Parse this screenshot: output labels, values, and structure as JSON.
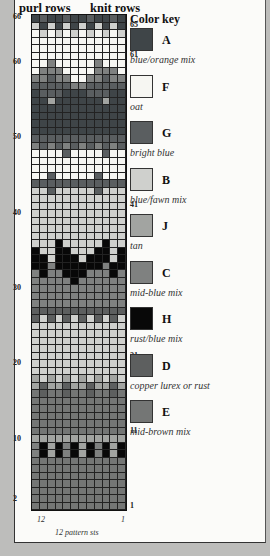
{
  "headers": {
    "purl": "purl rows",
    "knit": "knit rows"
  },
  "left_labels": [
    {
      "row": 66,
      "text": "66"
    },
    {
      "row": 60,
      "text": "60"
    },
    {
      "row": 50,
      "text": "50"
    },
    {
      "row": 40,
      "text": "40"
    },
    {
      "row": 30,
      "text": "30"
    },
    {
      "row": 20,
      "text": "20"
    },
    {
      "row": 10,
      "text": "10"
    },
    {
      "row": 2,
      "text": "2"
    }
  ],
  "right_labels": [
    {
      "row": 65,
      "text": "65"
    },
    {
      "row": 61,
      "text": "61"
    },
    {
      "row": 51,
      "text": "51"
    },
    {
      "row": 41,
      "text": "41"
    },
    {
      "row": 31,
      "text": "31"
    },
    {
      "row": 21,
      "text": "21"
    },
    {
      "row": 11,
      "text": "11"
    },
    {
      "row": 1,
      "text": "1"
    }
  ],
  "col_labels": {
    "left": "12",
    "right": "1"
  },
  "footer": "12 pattern sts",
  "key": {
    "title": "Color key",
    "items": [
      {
        "letter": "A",
        "desc": "blue/orange mix",
        "color": "#3f4548"
      },
      {
        "letter": "F",
        "desc": "oat",
        "color": "#f6f6f2"
      },
      {
        "letter": "G",
        "desc": "bright blue",
        "color": "#5a5e60"
      },
      {
        "letter": "B",
        "desc": "blue/fawn mix",
        "color": "#cfd0cd"
      },
      {
        "letter": "J",
        "desc": "tan",
        "color": "#a2a4a1"
      },
      {
        "letter": "C",
        "desc": "mid-blue mix",
        "color": "#7f8180"
      },
      {
        "letter": "H",
        "desc": "rust/blue mix",
        "color": "#080808"
      },
      {
        "letter": "D",
        "desc": "copper lurex or rust",
        "color": "#5d5f5f"
      },
      {
        "letter": "E",
        "desc": "mid-brown mix",
        "color": "#747675"
      }
    ]
  },
  "chart_data": {
    "type": "table",
    "title": "12 pattern sts",
    "rows_top_to_bottom": [
      "AGAAGAAGAAGA",
      "BABABABABABA",
      "FBFBFBFBFBFB",
      "FFFFFFFFFFFF",
      "FFFFFFFFFFFF",
      "FFFFFFFFFFFF",
      "FFCFFFFFCFFF",
      "FCCCFFFFCCCF",
      "CCGCCFFCCGCC",
      "GGGGGCCGGGGG",
      "AGGGAAAGGGAA",
      "AAJAAAAAAJAA",
      "AAAAAAAAAAAA",
      "AAAAAAAAAAAA",
      "AAAAAAAAAAAA",
      "AAAAAAAAAAAA",
      "GGGGGGGGGGGG",
      "CGCGCGCGCGCG",
      "FFFFGFFFFGFF",
      "FFFFFFFFFFFF",
      "FFFFFFFFFFFF",
      "FFGFFFFFGFFF",
      "GGGGGGGGGGGG",
      "BBGBBBBBGBBB",
      "BBBBBBBBBBBB",
      "BBBBBBBBBBBB",
      "BBBBBBBBBBBB",
      "BBBBBBBBBBBB",
      "BBBBBBBBBBBB",
      "BBBBBBBBBBBB",
      "BBBHBBBBBHBB",
      "HBBHHBBBHHBH",
      "HHBHHHBHHHBH",
      "HHCHHHHHHCHH",
      "CHCCHHHCCCHC",
      "CCCCCHCCCCCC",
      "CCCCCCCCCCCC",
      "CCCCCCCCCCCC",
      "CCCCCCCCCCCC",
      "DDDDDDDDDDDD",
      "DBDBDBDBDBDB",
      "BBBBBBBBBBBB",
      "BBBBBBBBBBBB",
      "BBBBBBBBBBBB",
      "BBBBBBBBBBBB",
      "BBBBBBBBBBBB",
      "BBBBBBBBBBBB",
      "BBBBBBBBBBBB",
      "JBJBJBJBJBJB",
      "JDJJDJJDJJDJ",
      "EDEEDEEDEEDE",
      "EEEEEEEEEEEE",
      "EEEEEEEEEEEE",
      "EEEEEEEEEEEE",
      "EEEEEEEEEEEE",
      "EEEEEEEEEEEE",
      "JJJJJJJJJJJJ",
      "CHJHCHJHCHJH",
      "CHJHCHJHCHJH",
      "EEEEEEEEEEEE",
      "EEEEEEEEEEEE",
      "EEEEEEEEEEEE",
      "EEEEEEEEEEEE",
      "EEEEEEEEEEEE",
      "EEEEEEEEEEEE",
      "EEEEEEEEEEEE"
    ],
    "row_count": 66,
    "stitch_count": 12
  }
}
